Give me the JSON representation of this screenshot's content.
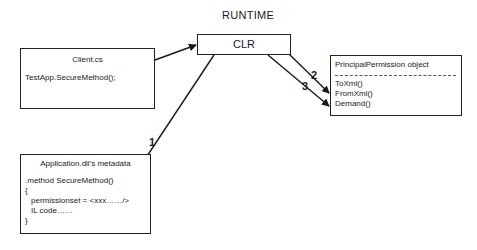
{
  "diagram": {
    "title": "RUNTIME",
    "nodes": {
      "clr": {
        "label": "CLR"
      },
      "client": {
        "title": "Client.cs",
        "lines": [
          "TestApp.SecureMethod();"
        ]
      },
      "principal_permission": {
        "title": "PrincipalPermission object",
        "methods": [
          "ToXml()",
          "FromXml()",
          "Demand()"
        ]
      },
      "application_metadata": {
        "title": "Application.dll's metadata",
        "lines": [
          ".method SecureMethod()",
          "{",
          "permissionset = <xxx……/>",
          "IL code……",
          "}"
        ]
      }
    },
    "edges": [
      {
        "from": "client",
        "to": "clr",
        "label": ""
      },
      {
        "from": "clr",
        "to": "application_metadata",
        "label": "1"
      },
      {
        "from": "clr",
        "to": "principal_permission",
        "label": "2"
      },
      {
        "from": "clr",
        "to": "principal_permission",
        "label": "3"
      }
    ]
  }
}
